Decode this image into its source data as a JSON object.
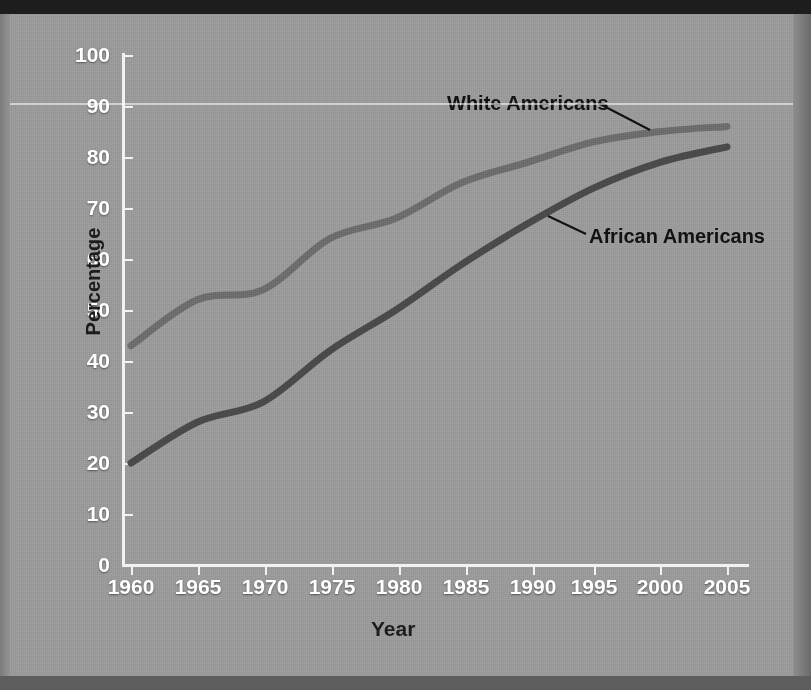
{
  "figure": {
    "background_color": "#9a9a9a",
    "axis_color": "#f2f2f2",
    "annotation_color": "#121212"
  },
  "axes": {
    "y_title": "Percentage",
    "x_title": "Year",
    "y_ticks": [
      "0",
      "10",
      "20",
      "30",
      "40",
      "50",
      "60",
      "70",
      "80",
      "90",
      "100"
    ],
    "x_ticks": [
      "1960",
      "1965",
      "1970",
      "1975",
      "1980",
      "1985",
      "1990",
      "1995",
      "2000",
      "2005"
    ]
  },
  "annotations": {
    "white": "White Americans",
    "african": "African Americans"
  },
  "chart_data": {
    "type": "line",
    "title": "",
    "xlabel": "Year",
    "ylabel": "Percentage",
    "x": [
      1960,
      1965,
      1970,
      1975,
      1980,
      1985,
      1990,
      1995,
      2000,
      2005
    ],
    "xlim": [
      1960,
      2005
    ],
    "ylim": [
      0,
      100
    ],
    "grid": false,
    "legend": "inline-annotations",
    "series": [
      {
        "name": "White Americans",
        "color": "#6d6d6d",
        "values": [
          43,
          52,
          54,
          64,
          68,
          75,
          79,
          83,
          85,
          86
        ]
      },
      {
        "name": "African Americans",
        "color": "#4a4a4a",
        "values": [
          20,
          28,
          32,
          42,
          50,
          59,
          67,
          74,
          79,
          82
        ]
      }
    ]
  }
}
